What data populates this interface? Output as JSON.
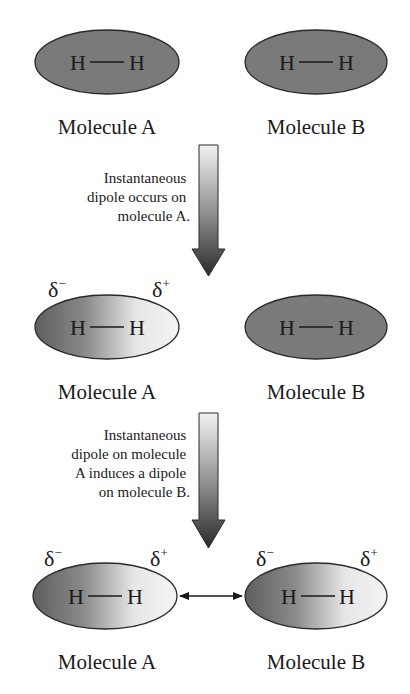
{
  "colors": {
    "molecule_fill": "#7a7a7a",
    "molecule_stroke": "#2a2a2a",
    "gradient_dark": "#6a6a6a",
    "gradient_light": "#f2f2f2",
    "arrow_top": "#f0f0f0",
    "arrow_bottom": "#2e2e2e",
    "text": "#1a1a1a"
  },
  "stages": [
    {
      "molecules": [
        {
          "name": "Molecule A",
          "atoms": [
            "H",
            "H"
          ],
          "polarized": false
        },
        {
          "name": "Molecule B",
          "atoms": [
            "H",
            "H"
          ],
          "polarized": false
        }
      ]
    },
    {
      "molecules": [
        {
          "name": "Molecule A",
          "atoms": [
            "H",
            "H"
          ],
          "polarized": true,
          "delta_left": "δ",
          "delta_left_sign": "−",
          "delta_right": "δ",
          "delta_right_sign": "+"
        },
        {
          "name": "Molecule B",
          "atoms": [
            "H",
            "H"
          ],
          "polarized": false
        }
      ]
    },
    {
      "molecules": [
        {
          "name": "Molecule A",
          "atoms": [
            "H",
            "H"
          ],
          "polarized": true,
          "delta_left": "δ",
          "delta_left_sign": "−",
          "delta_right": "δ",
          "delta_right_sign": "+"
        },
        {
          "name": "Molecule B",
          "atoms": [
            "H",
            "H"
          ],
          "polarized": true,
          "delta_left": "δ",
          "delta_left_sign": "−",
          "delta_right": "δ",
          "delta_right_sign": "+"
        }
      ],
      "interaction": "attraction"
    }
  ],
  "transitions": [
    {
      "caption_lines": [
        "Instantaneous",
        "dipole occurs on",
        "molecule A."
      ]
    },
    {
      "caption_lines": [
        "Instantaneous",
        "dipole on molecule",
        "A induces a dipole",
        "on molecule B."
      ]
    }
  ]
}
